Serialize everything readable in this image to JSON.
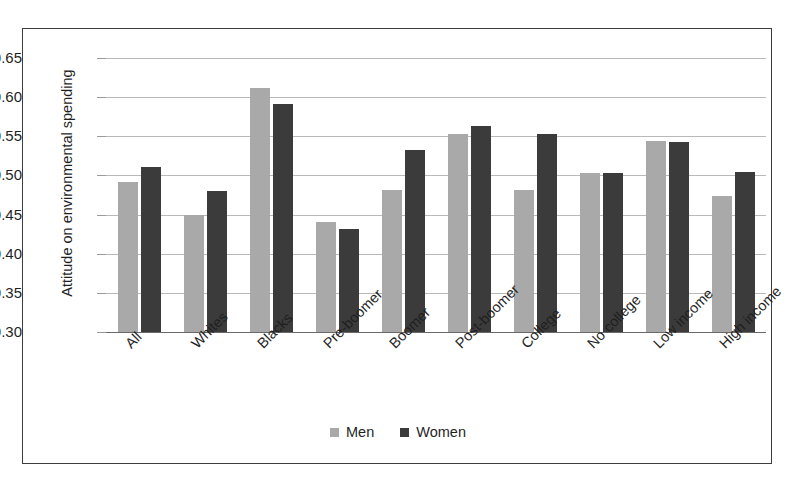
{
  "chart_data": {
    "type": "bar",
    "title": "",
    "xlabel": "",
    "ylabel": "Attitude on environmental spending",
    "ylim": [
      0.3,
      0.65
    ],
    "ytick_labels": [
      "0.65",
      "0.60",
      "0.55",
      "0.50",
      "0.45",
      "0.40",
      "0.35",
      "0.30"
    ],
    "ytick_values": [
      0.65,
      0.6,
      0.55,
      0.5,
      0.45,
      0.4,
      0.35,
      0.3
    ],
    "ytick_step": 0.05,
    "grid": true,
    "legend_position": "bottom-center",
    "categories": [
      "All",
      "Whites",
      "Blacks",
      "Pre-boomer",
      "Boomer",
      "Post-boomer",
      "College",
      "No college",
      "Low income",
      "High income"
    ],
    "series": [
      {
        "name": "Men",
        "color": "#a9a9a9",
        "values": [
          0.491,
          0.45,
          0.612,
          0.441,
          0.482,
          0.553,
          0.482,
          0.503,
          0.544,
          0.474
        ]
      },
      {
        "name": "Women",
        "color": "#3b3b3b",
        "values": [
          0.511,
          0.48,
          0.591,
          0.431,
          0.532,
          0.563,
          0.553,
          0.503,
          0.543,
          0.504
        ]
      }
    ]
  },
  "figure": {
    "border_color": "#3d3d3d",
    "background": "#ffffff",
    "gridline_color": "#b9b9b9",
    "axis_color": "#6a6a6a"
  }
}
